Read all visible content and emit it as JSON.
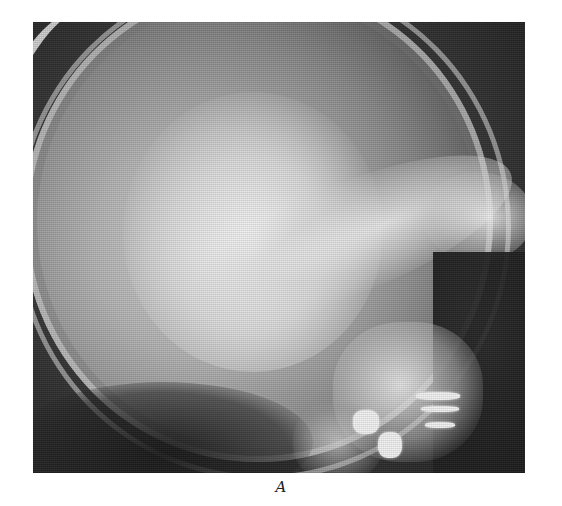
{
  "figure": {
    "panel_label": "A",
    "colors": {
      "background": "#ffffff",
      "film_dark": "#2a2a2a",
      "bone_bright": "#f4f4f4",
      "caption_text": "#222222"
    }
  }
}
